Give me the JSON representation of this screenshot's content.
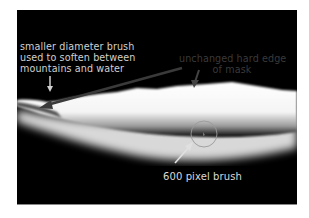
{
  "figure": {
    "background_color": "#000000",
    "band_color": "#ffffff",
    "annotations": [
      {
        "id": "smaller-brush",
        "text": "smaller diameter brush\nused to soften between\nmountains and water",
        "color": "#d0d0d0"
      },
      {
        "id": "hard-edge",
        "text": "unchanged hard edge\nof mask",
        "color": "#3a3a3a"
      },
      {
        "id": "big-brush",
        "text": "600 pixel brush",
        "color": "#d8d8d8"
      }
    ],
    "brush_cursor": {
      "shape": "circle",
      "color": "#9a9a9a"
    }
  }
}
